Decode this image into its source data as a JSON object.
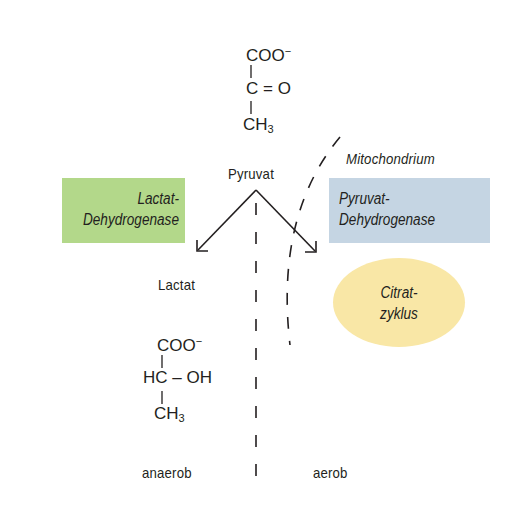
{
  "diagram": {
    "pyruvate": {
      "name": "Pyruvat",
      "formula": {
        "top": "COO",
        "charge": "−",
        "middle_left": "C",
        "middle_bond": "=",
        "middle_right": "O",
        "bottom": "CH",
        "bottom_sub": "3"
      }
    },
    "enzymes": {
      "left": {
        "line1": "Lactat-",
        "line2": "Dehydrogenase",
        "color": "#b3d88a"
      },
      "right": {
        "line1": "Pyruvat-",
        "line2": "Dehydrogenase",
        "color": "#c5d5e3"
      }
    },
    "compartment": {
      "label": "Mitochondrium"
    },
    "cycle": {
      "line1": "Citrat-",
      "line2": "zyklus",
      "color": "#f9e7a6"
    },
    "lactate": {
      "name": "Lactat",
      "formula": {
        "top": "COO",
        "charge": "−",
        "middle_left": "HC",
        "middle_bond": "–",
        "middle_right": "OH",
        "bottom": "CH",
        "bottom_sub": "3"
      }
    },
    "conditions": {
      "left": "anaerob",
      "right": "aerob"
    }
  }
}
